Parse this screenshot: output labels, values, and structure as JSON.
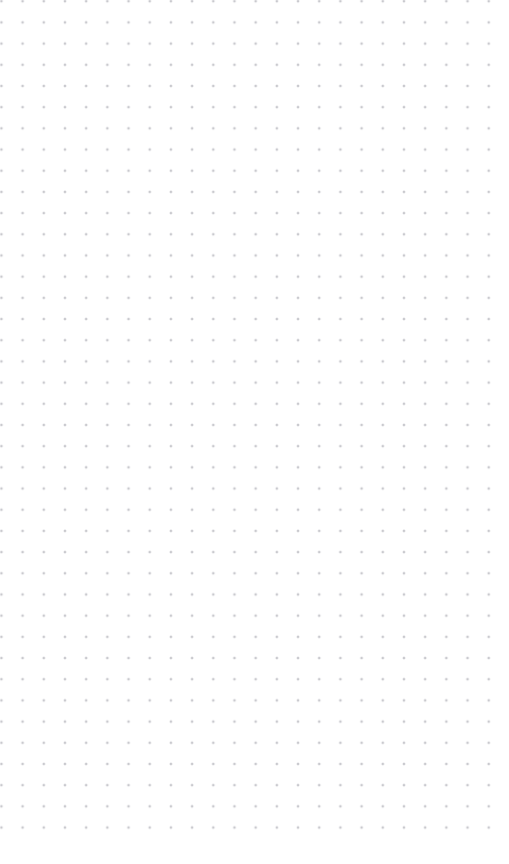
{
  "page": {
    "width": 509,
    "height": 864,
    "background_color": "#ffffff"
  },
  "grid": {
    "name": "dot-grid",
    "pattern": "square lattice of dots",
    "dot_color": "#c9c9ce",
    "dot_diameter_px": 1.7,
    "spacing_x_px": 21.2,
    "spacing_y_px": 21.2,
    "origin_x_px": 12,
    "origin_y_px": 33,
    "columns": 23,
    "rows": 39,
    "last_row_y_px": 832,
    "last_column_x_px": 487
  },
  "margins": {
    "top_px": 33,
    "left_px": 12,
    "right_px": 22,
    "bottom_px": 32
  },
  "content": {
    "items": [],
    "text": "",
    "is_empty": true
  }
}
